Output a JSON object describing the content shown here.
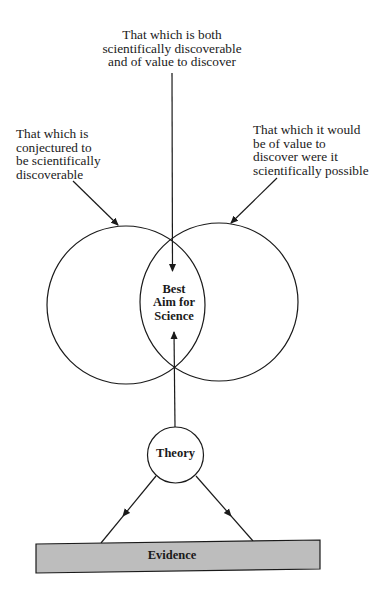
{
  "diagram": {
    "top_label": {
      "lines": [
        "That which is both",
        "scientifically discoverable",
        "and of value to discover"
      ]
    },
    "left_label": {
      "lines": [
        "That which is",
        "conjectured to",
        "be scientifically",
        "discoverable"
      ]
    },
    "right_label": {
      "lines": [
        "That which it would",
        "be of value to",
        "discover were it",
        "scientifically possible"
      ]
    },
    "intersection_label": {
      "lines": [
        "Best",
        "Aim for",
        "Science"
      ]
    },
    "theory_node": {
      "label": "Theory"
    },
    "evidence_bar": {
      "label": "Evidence",
      "fill": "#bdbdbd"
    },
    "colors": {
      "stroke": "#1a1a1a",
      "background": "#ffffff"
    }
  }
}
